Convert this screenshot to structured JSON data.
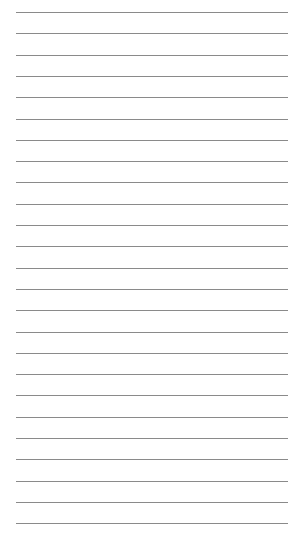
{
  "paper": {
    "type": "lined-paper",
    "line_count": 25,
    "first_line_y": 12,
    "line_spacing": 21.3,
    "line_left": 16,
    "line_width": 272,
    "line_color": "#8a8a8a",
    "background_color": "#ffffff"
  }
}
